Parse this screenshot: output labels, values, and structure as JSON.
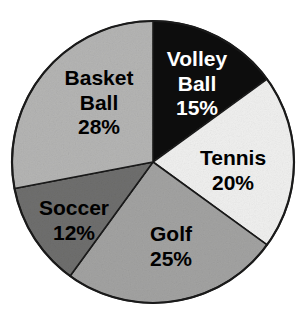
{
  "figure": {
    "background_color": "#ffffff",
    "outline_color": "#1a1a1a",
    "width": 305,
    "height": 321,
    "center_x": 153,
    "center_y": 162,
    "radius": 141
  },
  "chart_data": {
    "type": "pie",
    "title": "",
    "subtitle": "",
    "xlabel": "",
    "ylabel": "",
    "legend_position": "none",
    "labels_inside_slices": true,
    "start_angle_deg": 0,
    "direction": "clockwise",
    "units": "percent",
    "total": 100,
    "categories": [
      "Volley Ball",
      "Tennis",
      "Golf",
      "Soccer",
      "Basket Ball"
    ],
    "values": [
      15,
      20,
      25,
      12,
      28
    ],
    "slices": [
      {
        "name": "volley-ball",
        "label_line1": "Volley",
        "label_line2": "Ball",
        "value": 15,
        "value_label": "15%",
        "start_deg": 0,
        "end_deg": 54,
        "fill": "#0d0d0d",
        "text_color": "#ffffff",
        "label_x": 197,
        "label_y": 85,
        "font_size": 21,
        "lines": 3
      },
      {
        "name": "tennis",
        "label_line1": "Tennis",
        "label_line2": "",
        "value": 20,
        "value_label": "20%",
        "start_deg": 54,
        "end_deg": 126,
        "fill": "#f0f0ef",
        "text_color": "#000000",
        "label_x": 233,
        "label_y": 172,
        "font_size": 21,
        "lines": 2
      },
      {
        "name": "golf",
        "label_line1": "Golf",
        "label_line2": "",
        "value": 25,
        "value_label": "25%",
        "start_deg": 126,
        "end_deg": 216,
        "fill": "#a3a3a2",
        "text_color": "#000000",
        "label_x": 171,
        "label_y": 248,
        "font_size": 21,
        "lines": 2
      },
      {
        "name": "soccer",
        "label_line1": "Soccer",
        "label_line2": "",
        "value": 12,
        "value_label": "12%",
        "start_deg": 216,
        "end_deg": 259.2,
        "fill": "#6f6f6e",
        "text_color": "#000000",
        "label_x": 74,
        "label_y": 222,
        "font_size": 21,
        "lines": 2
      },
      {
        "name": "basket-ball",
        "label_line1": "Basket",
        "label_line2": "Ball",
        "value": 28,
        "value_label": "28%",
        "start_deg": 259.2,
        "end_deg": 360,
        "fill": "#b5b5b4",
        "text_color": "#000000",
        "label_x": 99,
        "label_y": 104,
        "font_size": 21,
        "lines": 3
      }
    ]
  }
}
